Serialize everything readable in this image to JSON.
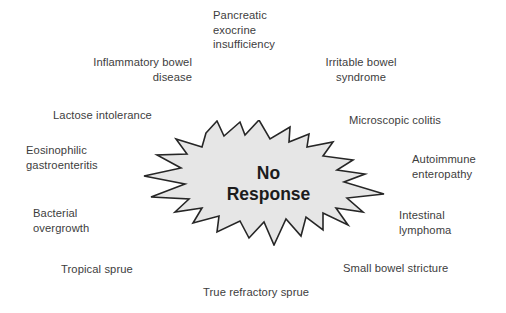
{
  "figure": {
    "type": "radial-label-diagram",
    "background_color": "#ffffff",
    "center": {
      "shape": "starburst-explosion",
      "label": "No\nResponse",
      "fill_color": "#e6e6e6",
      "stroke_color": "#262626"
    },
    "label_color": "#3d3d3d",
    "labels": [
      {
        "id": "pancreatic-exocrine-insufficiency",
        "text": "Pancreatic\nexocrine\ninsufficiency",
        "align": "left",
        "x": 213,
        "y": 8,
        "width": 92
      },
      {
        "id": "inflammatory-bowel-disease",
        "text": "Inflammatory bowel\ndisease",
        "align": "right",
        "x": 80,
        "y": 55,
        "width": 112
      },
      {
        "id": "irritable-bowel-syndrome",
        "text": "Irritable bowel\nsyndrome",
        "align": "center",
        "x": 318,
        "y": 55,
        "width": 86
      },
      {
        "id": "lactose-intolerance",
        "text": "Lactose intolerance",
        "align": "left",
        "x": 53,
        "y": 108,
        "width": 116
      },
      {
        "id": "microscopic-colitis",
        "text": "Microscopic colitis",
        "align": "left",
        "x": 349,
        "y": 113,
        "width": 110
      },
      {
        "id": "eosinophilic-gastroenteritis",
        "text": "Eosinophilic\ngastroenteritis",
        "align": "left",
        "x": 26,
        "y": 143,
        "width": 96
      },
      {
        "id": "autoimmune-enteropathy",
        "text": "Autoimmune\nenteropathy",
        "align": "left",
        "x": 412,
        "y": 152,
        "width": 86
      },
      {
        "id": "bacterial-overgrowth",
        "text": "Bacterial\novergrowth",
        "align": "left",
        "x": 33,
        "y": 206,
        "width": 86
      },
      {
        "id": "intestinal-lymphoma",
        "text": "Intestinal\nlymphoma",
        "align": "left",
        "x": 399,
        "y": 208,
        "width": 80
      },
      {
        "id": "tropical-sprue",
        "text": "Tropical sprue",
        "align": "left",
        "x": 61,
        "y": 262,
        "width": 86
      },
      {
        "id": "small-bowel-stricture",
        "text": "Small bowel stricture",
        "align": "left",
        "x": 343,
        "y": 261,
        "width": 124
      },
      {
        "id": "true-refractory-sprue",
        "text": "True refractory sprue",
        "align": "left",
        "x": 203,
        "y": 285,
        "width": 124
      }
    ]
  }
}
